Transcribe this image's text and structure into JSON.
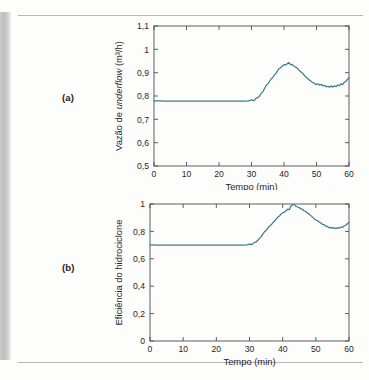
{
  "figure": {
    "panel_a_label": "(a)",
    "panel_b_label": "(b)",
    "line_color": "#3a7d8c",
    "axis_color": "#4d4d4d"
  },
  "chart_data": [
    {
      "type": "line",
      "panel": "(a)",
      "title": "",
      "xlabel": "Tempo (min)",
      "ylabel": "Vazão de underflow (m³/h)",
      "ylabel_parts": {
        "prefix": "Vazão de ",
        "italic": "underflow",
        "suffix": " (m³/h)"
      },
      "xlim": [
        0,
        60
      ],
      "ylim": [
        0.5,
        1.1
      ],
      "xticks": [
        0,
        10,
        20,
        30,
        40,
        50,
        60
      ],
      "xticklabels": [
        "0",
        "10",
        "20",
        "30",
        "40",
        "50",
        "60"
      ],
      "yticks": [
        0.5,
        0.6,
        0.7,
        0.8,
        0.9,
        1.0,
        1.1
      ],
      "yticklabels": [
        "0,5",
        "0,6",
        "0,7",
        "0,8",
        "0,9",
        "1",
        "1,1"
      ],
      "grid": false,
      "legend": "none",
      "series": [
        {
          "name": "Vazão de underflow",
          "x": [
            0,
            1,
            2,
            3,
            4,
            5,
            6,
            7,
            8,
            9,
            10,
            11,
            12,
            13,
            14,
            15,
            16,
            17,
            18,
            19,
            20,
            21,
            22,
            23,
            24,
            25,
            26,
            27,
            28,
            29,
            29.5,
            30,
            30.5,
            31,
            31.5,
            32,
            32.5,
            33,
            33.5,
            34,
            34.5,
            35,
            35.5,
            36,
            36.5,
            37,
            37.5,
            38,
            38.5,
            39,
            39.5,
            40,
            40.5,
            41,
            41.5,
            42,
            42.5,
            43,
            43.5,
            44,
            44.5,
            45,
            45.5,
            46,
            46.5,
            47,
            47.5,
            48,
            48.5,
            49,
            49.5,
            50,
            50.5,
            51,
            51.5,
            52,
            52.5,
            53,
            53.5,
            54,
            54.5,
            55,
            55.5,
            56,
            56.5,
            57,
            57.5,
            58,
            58.5,
            59,
            59.5,
            60
          ],
          "y": [
            0.779,
            0.779,
            0.779,
            0.778,
            0.778,
            0.778,
            0.778,
            0.778,
            0.778,
            0.778,
            0.778,
            0.778,
            0.778,
            0.778,
            0.778,
            0.778,
            0.778,
            0.778,
            0.778,
            0.778,
            0.778,
            0.778,
            0.778,
            0.778,
            0.778,
            0.778,
            0.778,
            0.778,
            0.778,
            0.779,
            0.781,
            0.784,
            0.78,
            0.783,
            0.792,
            0.793,
            0.8,
            0.812,
            0.818,
            0.832,
            0.845,
            0.852,
            0.862,
            0.873,
            0.878,
            0.89,
            0.896,
            0.908,
            0.917,
            0.921,
            0.929,
            0.934,
            0.933,
            0.938,
            0.943,
            0.935,
            0.935,
            0.929,
            0.924,
            0.921,
            0.912,
            0.906,
            0.9,
            0.893,
            0.884,
            0.878,
            0.872,
            0.866,
            0.861,
            0.857,
            0.853,
            0.849,
            0.852,
            0.846,
            0.85,
            0.843,
            0.846,
            0.839,
            0.842,
            0.838,
            0.843,
            0.838,
            0.844,
            0.84,
            0.847,
            0.844,
            0.852,
            0.849,
            0.858,
            0.862,
            0.871,
            0.879,
            0.89
          ]
        }
      ]
    },
    {
      "type": "line",
      "panel": "(b)",
      "title": "",
      "xlabel": "Tempo (min)",
      "ylabel": "Eficiência do hidrociclone",
      "xlim": [
        0,
        60
      ],
      "ylim": [
        0,
        1
      ],
      "xticks": [
        0,
        10,
        20,
        30,
        40,
        50,
        60
      ],
      "xticklabels": [
        "0",
        "10",
        "20",
        "30",
        "40",
        "50",
        "60"
      ],
      "yticks": [
        0,
        0.2,
        0.4,
        0.6,
        0.8,
        1.0
      ],
      "yticklabels": [
        "0",
        "0,2",
        "0,4",
        "0,6",
        "0,8",
        "1"
      ],
      "grid": false,
      "legend": "none",
      "series": [
        {
          "name": "Eficiência do hidrociclone",
          "x": [
            0,
            1,
            2,
            3,
            4,
            5,
            6,
            7,
            8,
            9,
            10,
            11,
            12,
            13,
            14,
            15,
            16,
            17,
            18,
            19,
            20,
            21,
            22,
            23,
            24,
            25,
            26,
            27,
            28,
            29,
            29.5,
            30,
            30.5,
            31,
            31.5,
            32,
            32.5,
            33,
            33.5,
            34,
            34.5,
            35,
            35.5,
            36,
            36.5,
            37,
            37.5,
            38,
            38.5,
            39,
            39.5,
            40,
            40.5,
            41,
            41.5,
            42,
            42.5,
            43,
            43.5,
            44,
            44.5,
            45,
            45.5,
            46,
            46.5,
            47,
            47.5,
            48,
            48.5,
            49,
            49.5,
            50,
            50.5,
            51,
            51.5,
            52,
            52.5,
            53,
            53.5,
            54,
            54.5,
            55,
            55.5,
            56,
            56.5,
            57,
            57.5,
            58,
            58.5,
            59,
            59.5,
            60
          ],
          "y": [
            0.701,
            0.701,
            0.7,
            0.7,
            0.7,
            0.7,
            0.7,
            0.7,
            0.7,
            0.7,
            0.7,
            0.7,
            0.7,
            0.7,
            0.7,
            0.7,
            0.7,
            0.7,
            0.7,
            0.7,
            0.7,
            0.7,
            0.7,
            0.7,
            0.7,
            0.7,
            0.7,
            0.7,
            0.7,
            0.701,
            0.703,
            0.707,
            0.704,
            0.709,
            0.72,
            0.723,
            0.735,
            0.75,
            0.76,
            0.78,
            0.797,
            0.807,
            0.822,
            0.838,
            0.846,
            0.862,
            0.874,
            0.889,
            0.903,
            0.912,
            0.926,
            0.936,
            0.94,
            0.951,
            0.962,
            0.958,
            0.985,
            0.995,
            0.996,
            0.983,
            0.978,
            0.975,
            0.964,
            0.962,
            0.949,
            0.945,
            0.935,
            0.925,
            0.915,
            0.904,
            0.893,
            0.883,
            0.878,
            0.868,
            0.862,
            0.852,
            0.849,
            0.838,
            0.836,
            0.826,
            0.83,
            0.822,
            0.828,
            0.82,
            0.827,
            0.822,
            0.832,
            0.828,
            0.84,
            0.845,
            0.856,
            0.866,
            0.878
          ]
        }
      ]
    }
  ]
}
